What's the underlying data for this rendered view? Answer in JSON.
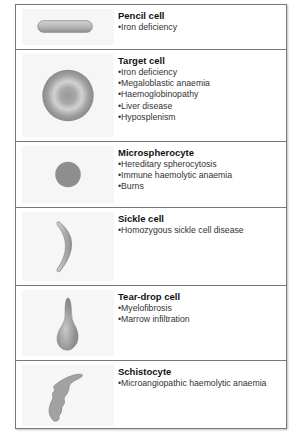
{
  "rows": [
    {
      "title": "Pencil cell",
      "items": [
        "Iron deficiency"
      ],
      "icon": "pencil-cell-icon"
    },
    {
      "title": "Target cell",
      "items": [
        "Iron deficiency",
        "Megaloblastic anaemia",
        "Haemoglobinopathy",
        "Liver disease",
        "Hyposplenism"
      ],
      "icon": "target-cell-icon"
    },
    {
      "title": "Microspherocyte",
      "items": [
        "Hereditary spherocytosis",
        "Immune haemolytic anaemia",
        "Burns"
      ],
      "icon": "microspherocyte-icon"
    },
    {
      "title": "Sickle cell",
      "items": [
        "Homozygous sickle cell disease"
      ],
      "icon": "sickle-cell-icon"
    },
    {
      "title": "Tear-drop cell",
      "items": [
        "Myelofibrosis",
        "Marrow infiltration"
      ],
      "icon": "tear-drop-cell-icon"
    },
    {
      "title": "Schistocyte",
      "items": [
        "Microangiopathic haemolytic anaemia"
      ],
      "icon": "schistocyte-icon"
    }
  ],
  "colors": {
    "border": "#777777",
    "cell_fill": "#a8a8a8",
    "panel_bg": "#f6f6f6"
  }
}
